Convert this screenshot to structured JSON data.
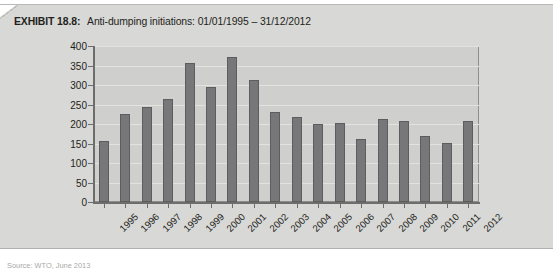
{
  "exhibit": {
    "label": "EXHIBIT 18.8:",
    "title": "Anti-dumping initiations: 01/01/1995 – 31/12/2012",
    "source": "Source: WTO, June 2013",
    "panel_color": "#d8d8d6",
    "plot_background": "#cfcfcd",
    "bar_color": "#77777a",
    "bar_border_color": "#5d5d60",
    "axis_color": "#6d6d6b",
    "gridline_color": "#e2e2e0"
  },
  "chart_data": {
    "type": "bar",
    "title": "Anti-dumping initiations: 01/01/1995 – 31/12/2012",
    "xlabel": "",
    "ylabel": "",
    "ylim": [
      0,
      400
    ],
    "ytick_interval": 50,
    "yticks": [
      0,
      50,
      100,
      150,
      200,
      250,
      300,
      350,
      400
    ],
    "grid": true,
    "legend": false,
    "categories": [
      "1995",
      "1996",
      "1997",
      "1998",
      "1999",
      "2000",
      "2001",
      "2002",
      "2003",
      "2004",
      "2005",
      "2006",
      "2007",
      "2008",
      "2009",
      "2010",
      "2011",
      "2012"
    ],
    "values": [
      157,
      225,
      244,
      264,
      356,
      296,
      371,
      312,
      232,
      219,
      199,
      202,
      162,
      212,
      208,
      169,
      152,
      207
    ]
  }
}
